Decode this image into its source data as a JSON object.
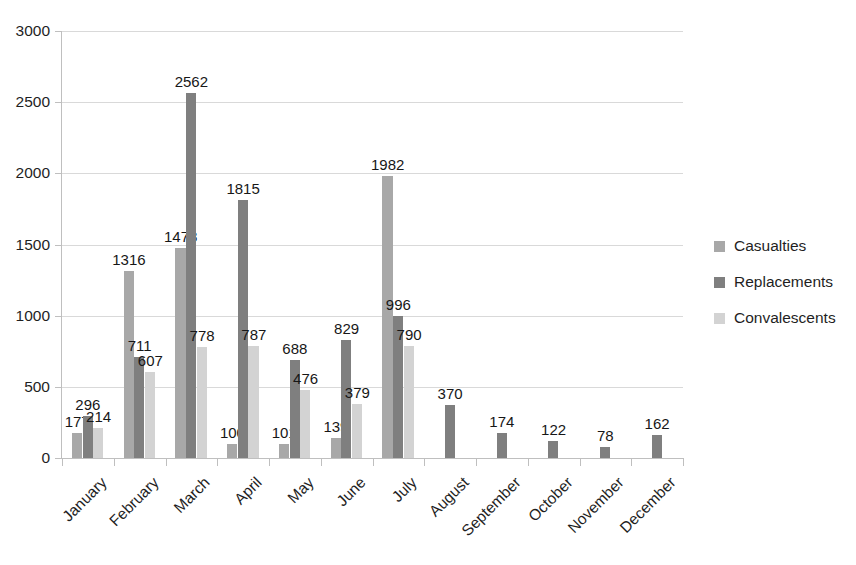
{
  "chart_data": {
    "type": "bar",
    "title": "",
    "subtitle": "",
    "xlabel": "",
    "ylabel": "",
    "ylim": [
      0,
      3000
    ],
    "ytick_step": 500,
    "ytick_labels": [
      "3000",
      "2500",
      "2000",
      "1500",
      "1000",
      "500",
      "0"
    ],
    "grid": true,
    "grid_axis": "y",
    "legend_position": "right",
    "categories": [
      "January",
      "February",
      "March",
      "April",
      "May",
      "June",
      "July",
      "August",
      "September",
      "October",
      "November",
      "December"
    ],
    "series": [
      {
        "name": "Casualties",
        "color": "#a8a8a8",
        "values": [
          177,
          1316,
          1478,
          100,
          101,
          139,
          1982,
          null,
          null,
          null,
          null,
          null
        ],
        "labels": [
          "177",
          "1316",
          "1478",
          "100",
          "101",
          "139",
          "1982",
          "",
          "",
          "",
          "",
          ""
        ]
      },
      {
        "name": "Replacements",
        "color": "#7f7f7f",
        "values": [
          296,
          711,
          2562,
          1815,
          688,
          829,
          996,
          370,
          174,
          122,
          78,
          162
        ],
        "labels": [
          "296",
          "711",
          "2562",
          "1815",
          "688",
          "829",
          "996",
          "370",
          "174",
          "122",
          "78",
          "162"
        ]
      },
      {
        "name": "Convalescents",
        "color": "#d3d3d3",
        "values": [
          214,
          607,
          778,
          787,
          476,
          379,
          790,
          null,
          null,
          null,
          null,
          null
        ],
        "labels": [
          "214",
          "607",
          "778",
          "787",
          "476",
          "379",
          "790",
          "",
          "",
          "",
          "",
          ""
        ]
      }
    ]
  },
  "legend": {
    "items": [
      {
        "label": "Casualties",
        "color": "#a8a8a8"
      },
      {
        "label": "Replacements",
        "color": "#7f7f7f"
      },
      {
        "label": "Convalescents",
        "color": "#d3d3d3"
      }
    ]
  },
  "axes": {
    "y": {
      "labels": [
        "3000",
        "2500",
        "2000",
        "1500",
        "1000",
        "500",
        "0"
      ]
    },
    "x": {
      "labels": [
        "January",
        "February",
        "March",
        "April",
        "May",
        "June",
        "July",
        "August",
        "September",
        "October",
        "November",
        "December"
      ]
    }
  },
  "style": {
    "gridline_color": "#d9d9d9",
    "axis_color": "#bfbfbf",
    "text_color": "#1f1f1f",
    "background": "#ffffff"
  }
}
